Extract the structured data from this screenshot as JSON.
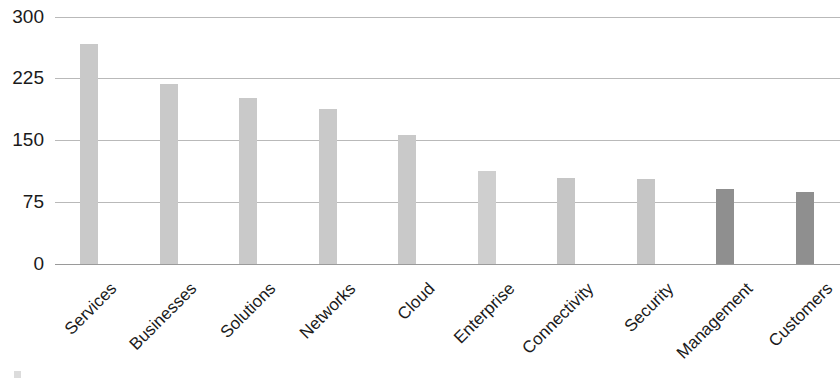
{
  "chart_data": {
    "type": "bar",
    "title": "",
    "subtitle": "",
    "xlabel": "",
    "ylabel": "",
    "categories": [
      "Services",
      "Businesses",
      "Solutions",
      "Networks",
      "Cloud",
      "Enterprise",
      "Connectivity",
      "Security",
      "Management",
      "Customers"
    ],
    "values": [
      267,
      219,
      202,
      188,
      157,
      113,
      104,
      103,
      91,
      87
    ],
    "bar_colors": [
      "#c9c9c9",
      "#c9c9c9",
      "#c9c9c9",
      "#c9c9c9",
      "#c9c9c9",
      "#cfcfcf",
      "#c6c6c6",
      "#c6c6c6",
      "#8f8f8f",
      "#8f8f8f"
    ],
    "ylim": [
      0,
      300
    ],
    "yticks": [
      300,
      225,
      150,
      75,
      0
    ],
    "ytick_labels": [
      "300",
      "225",
      "150",
      "75",
      "0"
    ],
    "grid": true,
    "grid_axis": "y",
    "legend": null,
    "legend_position": "none",
    "orientation": "vertical",
    "xtick_rotation": -45
  },
  "axis": {
    "y_ticks": [
      {
        "label": "300",
        "value": 300
      },
      {
        "label": "225",
        "value": 225
      },
      {
        "label": "150",
        "value": 150
      },
      {
        "label": "75",
        "value": 75
      },
      {
        "label": "0",
        "value": 0
      }
    ],
    "x_labels": [
      {
        "label": "Services"
      },
      {
        "label": "Businesses"
      },
      {
        "label": "Solutions"
      },
      {
        "label": "Networks"
      },
      {
        "label": "Cloud"
      },
      {
        "label": "Enterprise"
      },
      {
        "label": "Connectivity"
      },
      {
        "label": "Security"
      },
      {
        "label": "Management"
      },
      {
        "label": "Customers"
      }
    ]
  },
  "style": {
    "gridline_color": "#b9b9b9",
    "baseline_color": "#9a9a9a",
    "text_color": "#1a1a1a",
    "background": "#ffffff",
    "bar_light": "#c9c9c9",
    "bar_dark": "#8f8f8f"
  }
}
